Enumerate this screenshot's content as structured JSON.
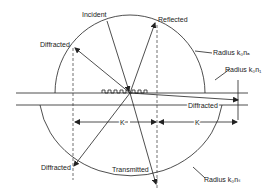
{
  "diagram": {
    "title": "",
    "labels": {
      "incident": "Incident",
      "reflected": "Reflected",
      "diffracted_upper": "Diffracted",
      "diffracted_lower": "Diffracted",
      "diffracted_right": "Diffracted",
      "transmitted": "Transmitted",
      "radius_na": "Radius k₀nₐ",
      "radius_n1": "Radius k₀n₁",
      "radius_ns": "Radius k₀nₛ",
      "k_left": "K",
      "k_right": "K"
    },
    "colors": {
      "line": "#222222",
      "background": "#ffffff"
    }
  }
}
